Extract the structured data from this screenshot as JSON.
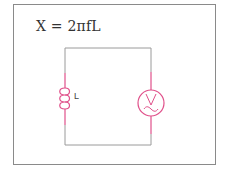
{
  "diagram": {
    "formula": "X = 2πfL",
    "components": [
      {
        "type": "inductor",
        "label": "L"
      },
      {
        "type": "ac-voltage-source",
        "label": "V"
      }
    ],
    "colors": {
      "frame": "#8a8a8a",
      "wire": "#9a9a9a",
      "component": "#e0508a",
      "text": "#333333"
    }
  }
}
